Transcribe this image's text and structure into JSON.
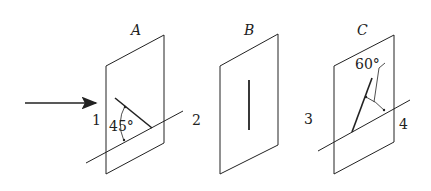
{
  "diagram": {
    "incident_arrow": {
      "label": ""
    },
    "panels": [
      {
        "id": "A",
        "label": "A",
        "side_labels": {
          "left": "1",
          "right": "2"
        },
        "angle_label": "45°",
        "inner_line_angle_deg": 45
      },
      {
        "id": "B",
        "label": "B",
        "inner_line_orientation": "vertical"
      },
      {
        "id": "C",
        "label": "C",
        "side_labels": {
          "left": "3",
          "right": "4"
        },
        "angle_label": "60°",
        "inner_line_angle_deg": 60
      }
    ],
    "colors": {
      "stroke": "#222222",
      "background": "#ffffff"
    }
  }
}
